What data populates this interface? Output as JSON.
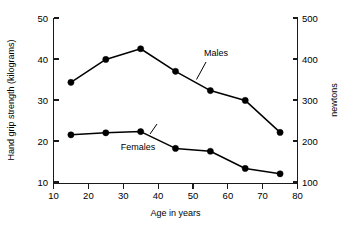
{
  "chart_data": {
    "type": "line",
    "title": "",
    "xlabel": "Age in years",
    "ylabel": "Hand grip strength (kilograms)",
    "y2label": "newtons",
    "xlim": [
      10,
      80
    ],
    "ylim": [
      5,
      50
    ],
    "y2lim": [
      50,
      500
    ],
    "grid": false,
    "legend_position": "inline-annotation",
    "x": [
      15,
      25,
      35,
      45,
      55,
      65,
      75
    ],
    "xticks": [
      10,
      20,
      30,
      40,
      50,
      60,
      70,
      80
    ],
    "yticks": [
      10,
      20,
      30,
      40,
      50
    ],
    "y2ticks": [
      100,
      200,
      300,
      400,
      500
    ],
    "series": [
      {
        "name": "Males",
        "values": [
          34.3,
          39.9,
          42.5,
          37.0,
          32.3,
          29.9,
          22.1
        ]
      },
      {
        "name": "Females",
        "values": [
          21.5,
          22.0,
          22.3,
          18.2,
          17.5,
          13.3,
          12.0
        ]
      }
    ],
    "annotations": [
      {
        "text": "Males",
        "x": 52,
        "y": 41.5
      },
      {
        "text": "Females",
        "x": 38,
        "y": 14.8
      }
    ]
  },
  "axes": {
    "left": {
      "title": "Hand grip strength (kilograms)",
      "ticks": [
        "10",
        "20",
        "30",
        "40",
        "50"
      ]
    },
    "right": {
      "title": "newtons",
      "ticks": [
        "100",
        "200",
        "300",
        "400",
        "500"
      ]
    },
    "bottom": {
      "title": "Age in years",
      "ticks": [
        "10",
        "20",
        "30",
        "40",
        "50",
        "60",
        "70",
        "80"
      ]
    }
  },
  "labels": {
    "males": "Males",
    "females": "Females"
  }
}
